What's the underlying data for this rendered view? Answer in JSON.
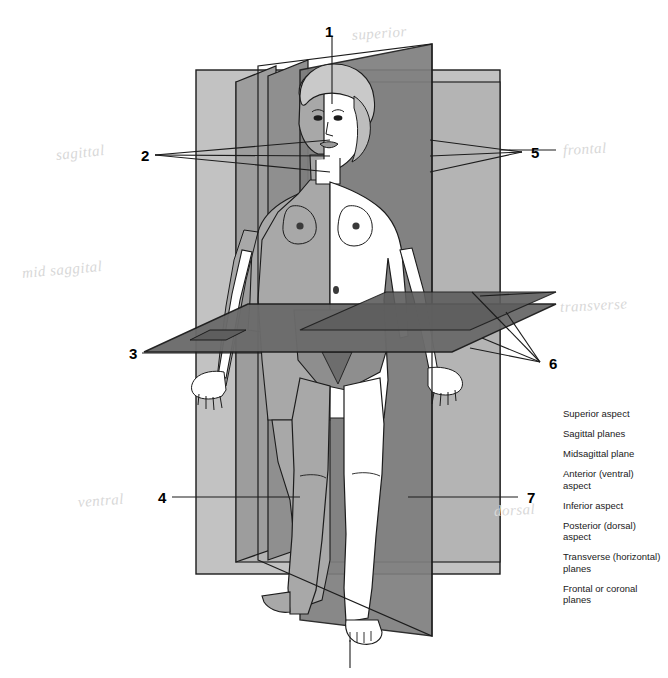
{
  "diagram": {
    "figure_name": "human-body-planes-figure"
  },
  "number_labels": [
    {
      "id": "1",
      "text": "1",
      "x": 325,
      "y": 24
    },
    {
      "id": "2",
      "text": "2",
      "x": 141,
      "y": 148
    },
    {
      "id": "3",
      "text": "3",
      "x": 129,
      "y": 348
    },
    {
      "id": "4",
      "text": "4",
      "x": 158,
      "y": 492
    },
    {
      "id": "5",
      "text": "5",
      "x": 531,
      "y": 145
    },
    {
      "id": "6",
      "text": "6",
      "x": 549,
      "y": 358
    },
    {
      "id": "7",
      "text": "7",
      "x": 527,
      "y": 492
    }
  ],
  "handwritten_notes": [
    {
      "text": "superior",
      "x": 352,
      "y": 28,
      "rotate": -4,
      "size": 15
    },
    {
      "text": "sagittal",
      "x": 56,
      "y": 148,
      "rotate": -6,
      "size": 15
    },
    {
      "text": "mid saggital",
      "x": 22,
      "y": 266,
      "rotate": -5,
      "size": 15
    },
    {
      "text": "frontal",
      "x": 563,
      "y": 143,
      "rotate": -3,
      "size": 15
    },
    {
      "text": "transverse",
      "x": 560,
      "y": 300,
      "rotate": -3,
      "size": 15
    },
    {
      "text": "ventral",
      "x": 78,
      "y": 495,
      "rotate": -4,
      "size": 15
    },
    {
      "text": "dorsal",
      "x": 494,
      "y": 504,
      "rotate": -3,
      "size": 15
    }
  ],
  "legend": {
    "name": "plane-terms-legend",
    "items": [
      "Superior aspect",
      "Sagittal planes",
      "Midsagittal plane",
      "Anterior (ventral) aspect",
      "Inferior aspect",
      "Posterior (dorsal) aspect",
      "Transverse (horizontal) planes",
      "Frontal or coronal planes"
    ]
  },
  "colors": {
    "plane_light": "#bdbdbd",
    "plane_mid": "#9a9a9a",
    "plane_dark": "#6f6f6f",
    "plane_darkest": "#585858",
    "body_shadow": "#a8a8a8",
    "body_light": "#ffffff",
    "outline": "#1c1c1c",
    "handwriting": "#dcdcdc"
  }
}
